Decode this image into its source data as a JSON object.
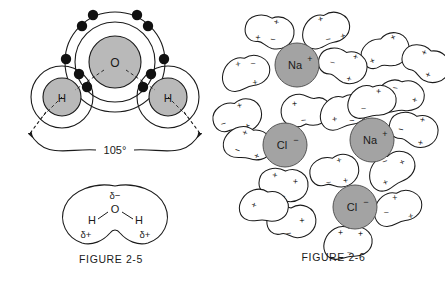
{
  "document": {
    "title": "Water molecule structure and ionic hydration",
    "background_color": "#ffffff",
    "line_color": "#1a1a1a"
  },
  "palette": {
    "atom_fill": "#b9b9b9",
    "ion_fill": "#a3a3a3",
    "electron_fill": "#111111",
    "water_blob_fill": "#ffffff",
    "stroke": "#1a1a1a"
  },
  "figure_2_5": {
    "caption": "FIGURE 2-5",
    "bond_angle_label": "105°",
    "atoms": [
      {
        "symbol": "O",
        "name": "oxygen-atom",
        "cx": 115,
        "cy": 62,
        "r": 26,
        "shell_radii": [
          40,
          50
        ]
      },
      {
        "symbol": "H",
        "name": "hydrogen-atom-left",
        "cx": 62,
        "cy": 97,
        "r": 19,
        "shell_radii": [
          31
        ]
      },
      {
        "symbol": "H",
        "name": "hydrogen-atom-right",
        "cx": 168,
        "cy": 97,
        "r": 19,
        "shell_radii": [
          31
        ]
      }
    ],
    "valence_electron_count": 10,
    "polarity_diagram": {
      "name": "water-dipole-blob",
      "oxygen_label": "O",
      "hydrogen_labels": [
        "H",
        "H"
      ],
      "partial_negative": "δ",
      "partial_negative_sign": "−",
      "partial_positive": "δ",
      "partial_positive_sign": "+",
      "charges": [
        {
          "label": "δ−",
          "position": "top-center-near-oxygen"
        },
        {
          "label": "δ+",
          "position": "bottom-left-near-hydrogen"
        },
        {
          "label": "δ+",
          "position": "bottom-right-near-hydrogen"
        }
      ]
    }
  },
  "figure_2_6": {
    "caption": "FIGURE 2-6",
    "ions": [
      {
        "label": "Na",
        "charge": "+",
        "name": "sodium-ion",
        "cx": 75,
        "cy": 65,
        "r": 22
      },
      {
        "label": "Cl",
        "charge": "−",
        "name": "chloride-ion",
        "cx": 63,
        "cy": 145,
        "r": 22
      },
      {
        "label": "Na",
        "charge": "+",
        "name": "sodium-ion",
        "cx": 150,
        "cy": 140,
        "r": 22
      },
      {
        "label": "Cl",
        "charge": "−",
        "name": "chloride-ion",
        "cx": 133,
        "cy": 207,
        "r": 22
      }
    ],
    "water_molecule_signs": {
      "positive": "+",
      "negative": "−"
    },
    "water_molecule_count": 20
  }
}
